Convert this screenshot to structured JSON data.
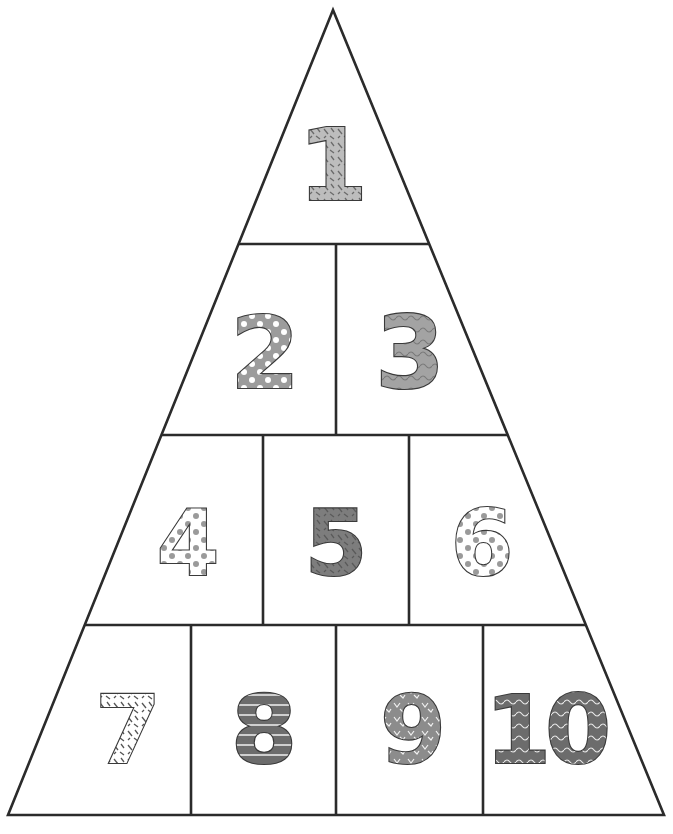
{
  "worksheet": {
    "title": "",
    "line_color": "#2b2b2b",
    "background": "#ffffff",
    "triangle": {
      "apex": [
        333,
        10
      ],
      "base_left": [
        8,
        815
      ],
      "base_right": [
        664,
        815
      ]
    },
    "rows": [
      {
        "y_bottom": 244,
        "dividers_x": []
      },
      {
        "y_bottom": 435,
        "dividers_x": [
          336
        ]
      },
      {
        "y_bottom": 625,
        "dividers_x": [
          263,
          409
        ]
      },
      {
        "y_bottom": 815,
        "dividers_x": [
          191,
          336,
          483
        ]
      }
    ],
    "cells": [
      {
        "label": "1",
        "cx": 333,
        "cy": 165,
        "size": 100,
        "fill": "#bdbdbd",
        "pattern": "dashes-dark",
        "pattern_color": "#6b6b6b"
      },
      {
        "label": "2",
        "cx": 265,
        "cy": 353,
        "size": 100,
        "fill": "#9c9c9c",
        "pattern": "dots-white",
        "pattern_color": "#ffffff"
      },
      {
        "label": "3",
        "cx": 410,
        "cy": 353,
        "size": 100,
        "fill": "#a3a3a3",
        "pattern": "waves-dark",
        "pattern_color": "#7a7a7a"
      },
      {
        "label": "4",
        "cx": 188,
        "cy": 543,
        "size": 90,
        "fill": "#ffffff",
        "pattern": "dots-gray",
        "pattern_color": "#9a9a9a"
      },
      {
        "label": "5",
        "cx": 336,
        "cy": 543,
        "size": 90,
        "fill": "#7d7d7d",
        "pattern": "dashes-dark",
        "pattern_color": "#5a5a5a"
      },
      {
        "label": "6",
        "cx": 482,
        "cy": 543,
        "size": 90,
        "fill": "#ffffff",
        "pattern": "dots-gray",
        "pattern_color": "#9a9a9a"
      },
      {
        "label": "7",
        "cx": 128,
        "cy": 730,
        "size": 95,
        "fill": "#ffffff",
        "pattern": "dashes-dark",
        "pattern_color": "#555555"
      },
      {
        "label": "8",
        "cx": 264,
        "cy": 730,
        "size": 95,
        "fill": "#6c6c6c",
        "pattern": "stripes-white",
        "pattern_color": "#e8e8e8"
      },
      {
        "label": "9",
        "cx": 413,
        "cy": 730,
        "size": 95,
        "fill": "#8c8c8c",
        "pattern": "chevrons-white",
        "pattern_color": "#f0f0f0"
      },
      {
        "label": "10",
        "cx": 545,
        "cy": 730,
        "size": 95,
        "fill": "#6c6c6c",
        "pattern": "waves-white",
        "pattern_color": "#e8e8e8"
      }
    ]
  }
}
